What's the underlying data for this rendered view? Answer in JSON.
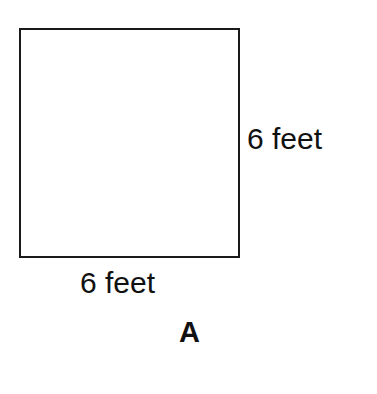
{
  "figure": {
    "shape": "square",
    "side_label": "6 feet",
    "bottom_label": "6 feet",
    "caption": "A"
  }
}
